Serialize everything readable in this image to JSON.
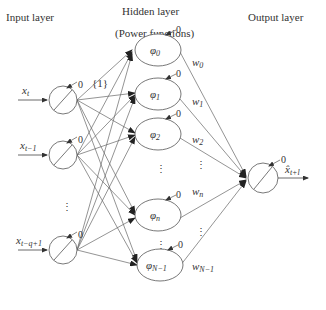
{
  "headers": {
    "input": "Input layer",
    "hidden": "Hidden layer",
    "hidden_sub": "(Power functions)",
    "output": "Output layer"
  },
  "bias_label": "{1}",
  "threshold": "0",
  "inputs": [
    {
      "base": "x",
      "sub": "t"
    },
    {
      "base": "x",
      "sub": "t−1"
    },
    {
      "base": "x",
      "sub": "t−q+1"
    }
  ],
  "hidden": [
    {
      "base": "φ",
      "sub": "0"
    },
    {
      "base": "φ",
      "sub": "1"
    },
    {
      "base": "φ",
      "sub": "2"
    },
    {
      "base": "φ",
      "sub": "n"
    },
    {
      "base": "φ",
      "sub": "N−1"
    }
  ],
  "weights": [
    {
      "base": "w",
      "sub": "0"
    },
    {
      "base": "w",
      "sub": "1"
    },
    {
      "base": "w",
      "sub": "2"
    },
    {
      "base": "w",
      "sub": "n"
    },
    {
      "base": "w",
      "sub": "N−1"
    }
  ],
  "output": {
    "base": "x̂",
    "sub": "t+l"
  },
  "ellipsis": "⋮",
  "colors": {
    "stroke": "#555555",
    "text": "#333333",
    "bg": "#ffffff"
  }
}
